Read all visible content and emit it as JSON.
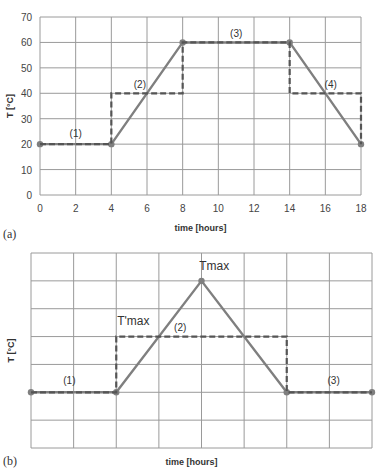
{
  "chart_data": [
    {
      "type": "line",
      "panel_label": "(a)",
      "xlabel": "time [hours]",
      "ylabel": "T [°C]",
      "xlim": [
        0,
        18
      ],
      "ylim": [
        0,
        70
      ],
      "xticks": [
        "0",
        "2",
        "4",
        "6",
        "8",
        "10",
        "12",
        "14",
        "16",
        "18"
      ],
      "yticks": [
        "0",
        "10",
        "20",
        "30",
        "40",
        "50",
        "60",
        "70"
      ],
      "grid": true,
      "series": [
        {
          "name": "ramp profile",
          "style": "solid",
          "x": [
            0,
            4,
            8,
            14,
            18
          ],
          "y": [
            20,
            20,
            60,
            60,
            20
          ]
        },
        {
          "name": "step profile",
          "style": "dashed",
          "x": [
            0,
            4,
            4,
            8,
            8,
            14,
            14,
            18,
            18
          ],
          "y": [
            20,
            20,
            40,
            40,
            60,
            60,
            40,
            40,
            20
          ]
        }
      ],
      "annotations": [
        {
          "text": "(1)",
          "x": 2,
          "y": 23
        },
        {
          "text": "(2)",
          "x": 5.6,
          "y": 42
        },
        {
          "text": "(3)",
          "x": 11,
          "y": 62
        },
        {
          "text": "(4)",
          "x": 16.3,
          "y": 42
        }
      ]
    },
    {
      "type": "line",
      "panel_label": "(b)",
      "xlabel": "time [hours]",
      "ylabel": "T [°C]",
      "xlim": [
        0,
        8
      ],
      "ylim": [
        0,
        7
      ],
      "grid": true,
      "series": [
        {
          "name": "ramp profile",
          "style": "solid",
          "x": [
            0,
            2,
            4,
            6,
            8
          ],
          "y": [
            2,
            2,
            6,
            2,
            2
          ]
        },
        {
          "name": "step profile",
          "style": "dashed",
          "x": [
            0,
            2,
            2,
            6,
            6,
            8
          ],
          "y": [
            2,
            2,
            4,
            4,
            2,
            2
          ]
        }
      ],
      "annotations": [
        {
          "text": "Tmax",
          "x": 4.3,
          "y": 6.4
        },
        {
          "text": "T'max",
          "x": 2.4,
          "y": 4.4
        },
        {
          "text": "(2)",
          "x": 3.5,
          "y": 4.2
        },
        {
          "text": "(1)",
          "x": 0.9,
          "y": 2.3
        },
        {
          "text": "(3)",
          "x": 7.1,
          "y": 2.3
        }
      ]
    }
  ]
}
